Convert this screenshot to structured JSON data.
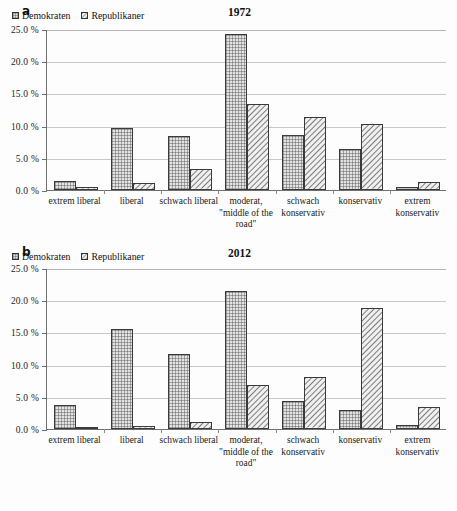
{
  "figure": {
    "panels": [
      {
        "letter": "a",
        "title": "1972",
        "legend": [
          {
            "label": "Demokraten",
            "pattern": "cross-hatch"
          },
          {
            "label": "Republikaner",
            "pattern": "diagonal-hatch"
          }
        ]
      },
      {
        "letter": "b",
        "title": "2012",
        "legend": [
          {
            "label": "Demokraten",
            "pattern": "cross-hatch"
          },
          {
            "label": "Republikaner",
            "pattern": "diagonal-hatch"
          }
        ]
      }
    ],
    "y_tick_labels": [
      "25.0 %",
      "20.0 %",
      "15.0 %",
      "10.0 %",
      "5.0 %",
      "0.0 %"
    ],
    "category_labels": [
      "extrem liberal",
      "liberal",
      "schwach liberal",
      "moderat, \"middle of the road\"",
      "schwach konservativ",
      "konservativ",
      "extrem konservativ"
    ]
  },
  "chart_data": [
    {
      "type": "bar",
      "title": "1972",
      "panel": "a",
      "xlabel": "",
      "ylabel": "",
      "ylim": [
        0,
        25
      ],
      "yticks": [
        0,
        5,
        10,
        15,
        20,
        25
      ],
      "ytick_labels": [
        "0.0 %",
        "5.0 %",
        "10.0 %",
        "15.0 %",
        "20.0 %",
        "25.0 %"
      ],
      "grid": true,
      "legend_position": "top-left",
      "categories": [
        "extrem liberal",
        "liberal",
        "schwach liberal",
        "moderat, \"middle of the road\"",
        "schwach konservativ",
        "konservativ",
        "extrem konservativ"
      ],
      "series": [
        {
          "name": "Demokraten",
          "values": [
            1.4,
            9.6,
            8.4,
            24.2,
            8.6,
            6.4,
            0.4
          ]
        },
        {
          "name": "Republikaner",
          "values": [
            0.4,
            1.1,
            3.2,
            13.4,
            11.4,
            10.2,
            1.2
          ]
        }
      ]
    },
    {
      "type": "bar",
      "title": "2012",
      "panel": "b",
      "xlabel": "",
      "ylabel": "",
      "ylim": [
        0,
        25
      ],
      "yticks": [
        0,
        5,
        10,
        15,
        20,
        25
      ],
      "ytick_labels": [
        "0.0 %",
        "5.0 %",
        "10.0 %",
        "15.0 %",
        "20.0 %",
        "25.0 %"
      ],
      "grid": true,
      "legend_position": "top-left",
      "categories": [
        "extrem liberal",
        "liberal",
        "schwach liberal",
        "moderat, \"middle of the road\"",
        "schwach konservativ",
        "konservativ",
        "extrem konservativ"
      ],
      "series": [
        {
          "name": "Demokraten",
          "values": [
            3.8,
            15.6,
            11.7,
            21.4,
            4.4,
            3.0,
            0.6
          ]
        },
        {
          "name": "Republikaner",
          "values": [
            0.2,
            0.4,
            1.1,
            6.9,
            8.0,
            18.8,
            3.4
          ]
        }
      ]
    }
  ],
  "colors": {
    "axis": "#6f6f6f",
    "grid": "#c8c8c8",
    "bar_outline": "#3a3a3a",
    "text": "#1a1a1a",
    "background": "#fdfdfd"
  }
}
